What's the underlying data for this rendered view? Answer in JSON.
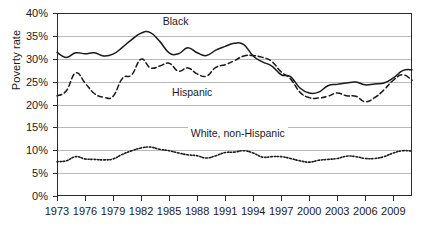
{
  "chart_data": {
    "type": "line",
    "title": "",
    "xlabel": "",
    "ylabel": "Poverty rate",
    "ylim": [
      0,
      40
    ],
    "xlim": [
      1973,
      2011
    ],
    "grid": true,
    "legend_position": "inline-annotations",
    "y_tick_labels": [
      "40%",
      "35%",
      "30%",
      "25%",
      "20%",
      "15%",
      "10%",
      "5%",
      "0%"
    ],
    "y_tick_values": [
      40,
      35,
      30,
      25,
      20,
      15,
      10,
      5,
      0
    ],
    "x_tick_labels": [
      "1973",
      "1976",
      "1979",
      "1982",
      "1985",
      "1988",
      "1991",
      "1994",
      "1997",
      "2000",
      "2003",
      "2006",
      "2009"
    ],
    "x_tick_values": [
      1973,
      1976,
      1979,
      1982,
      1985,
      1988,
      1991,
      1994,
      1997,
      2000,
      2003,
      2006,
      2009
    ],
    "x": [
      1973,
      1974,
      1975,
      1976,
      1977,
      1978,
      1979,
      1980,
      1981,
      1982,
      1983,
      1984,
      1985,
      1986,
      1987,
      1988,
      1989,
      1990,
      1991,
      1992,
      1993,
      1994,
      1995,
      1996,
      1997,
      1998,
      1999,
      2000,
      2001,
      2002,
      2003,
      2004,
      2005,
      2006,
      2007,
      2008,
      2009,
      2010,
      2011
    ],
    "series": [
      {
        "name": "Black",
        "style": "solid",
        "color": "#1a1a1a",
        "label_text": "Black",
        "values": [
          31.4,
          30.3,
          31.3,
          31.1,
          31.3,
          30.6,
          31.0,
          32.5,
          34.2,
          35.6,
          35.7,
          33.8,
          31.3,
          31.1,
          32.4,
          31.3,
          30.7,
          31.9,
          32.7,
          33.4,
          33.1,
          30.6,
          29.3,
          28.4,
          26.5,
          26.1,
          23.6,
          22.5,
          22.7,
          24.1,
          24.4,
          24.7,
          24.9,
          24.3,
          24.5,
          24.7,
          25.8,
          27.4,
          27.6
        ]
      },
      {
        "name": "Hispanic",
        "style": "dashed",
        "color": "#1a1a1a",
        "label_text": "Hispanic",
        "values": [
          21.9,
          23.0,
          26.9,
          24.7,
          22.4,
          21.6,
          21.8,
          25.7,
          26.5,
          29.9,
          28.0,
          28.4,
          29.0,
          27.3,
          28.0,
          26.7,
          26.2,
          28.1,
          28.7,
          29.6,
          30.6,
          30.7,
          30.3,
          29.4,
          27.1,
          25.6,
          22.7,
          21.5,
          21.4,
          21.8,
          22.5,
          21.9,
          21.8,
          20.6,
          21.5,
          23.2,
          25.3,
          26.5,
          25.3
        ]
      },
      {
        "name": "White, non-Hispanic",
        "style": "dotted",
        "color": "#1a1a1a",
        "label_text": "White, non-Hispanic",
        "values": [
          7.5,
          7.7,
          8.6,
          8.1,
          8.0,
          7.9,
          8.1,
          9.1,
          9.9,
          10.5,
          10.7,
          10.2,
          9.9,
          9.4,
          9.0,
          8.8,
          8.3,
          8.8,
          9.5,
          9.6,
          9.9,
          9.4,
          8.5,
          8.6,
          8.6,
          8.2,
          7.7,
          7.4,
          7.8,
          8.0,
          8.2,
          8.7,
          8.6,
          8.2,
          8.2,
          8.6,
          9.4,
          9.9,
          9.8
        ]
      }
    ],
    "annotations": [
      {
        "text": "Black",
        "x_year": 1984,
        "y_value": 38.0
      },
      {
        "text": "Hispanic",
        "x_year": 1985,
        "y_value": 22.5
      },
      {
        "text": "White, non-Hispanic",
        "x_year": 1987,
        "y_value": 13.5
      }
    ]
  }
}
